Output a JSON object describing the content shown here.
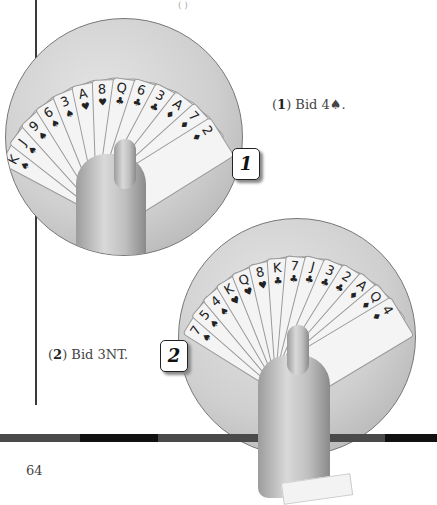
{
  "page": {
    "number": "64",
    "top_fragment": "(      )"
  },
  "figures": [
    {
      "label": "1",
      "caption_num": "1",
      "caption_text": " Bid 4♠.",
      "cards": [
        {
          "rank": "K",
          "suit": "♠"
        },
        {
          "rank": "J",
          "suit": "♠"
        },
        {
          "rank": "9",
          "suit": "♠"
        },
        {
          "rank": "6",
          "suit": "♠"
        },
        {
          "rank": "3",
          "suit": "♠"
        },
        {
          "rank": "A",
          "suit": "♥"
        },
        {
          "rank": "8",
          "suit": "♥"
        },
        {
          "rank": "Q",
          "suit": "♣"
        },
        {
          "rank": "6",
          "suit": "♣"
        },
        {
          "rank": "3",
          "suit": "♣"
        },
        {
          "rank": "A",
          "suit": "♦"
        },
        {
          "rank": "7",
          "suit": "♦"
        },
        {
          "rank": "2",
          "suit": "♦"
        }
      ]
    },
    {
      "label": "2",
      "caption_num": "2",
      "caption_text": " Bid 3NT.",
      "cards": [
        {
          "rank": "7",
          "suit": "♠"
        },
        {
          "rank": "5",
          "suit": "♠"
        },
        {
          "rank": "4",
          "suit": "♠"
        },
        {
          "rank": "K",
          "suit": "♥"
        },
        {
          "rank": "Q",
          "suit": "♥"
        },
        {
          "rank": "8",
          "suit": "♥"
        },
        {
          "rank": "K",
          "suit": "♣"
        },
        {
          "rank": "7",
          "suit": "♣"
        },
        {
          "rank": "J",
          "suit": "♣"
        },
        {
          "rank": "3",
          "suit": "♣"
        },
        {
          "rank": "2",
          "suit": "♣"
        },
        {
          "rank": "A",
          "suit": "♦"
        },
        {
          "rank": "Q",
          "suit": "♦"
        },
        {
          "rank": "4",
          "suit": "♦"
        }
      ]
    }
  ],
  "colors": {
    "rule": "#3a3a3a",
    "bar_dark": "#111111",
    "bar_light": "#4a4a4a",
    "circle": "#cfcfcf"
  }
}
